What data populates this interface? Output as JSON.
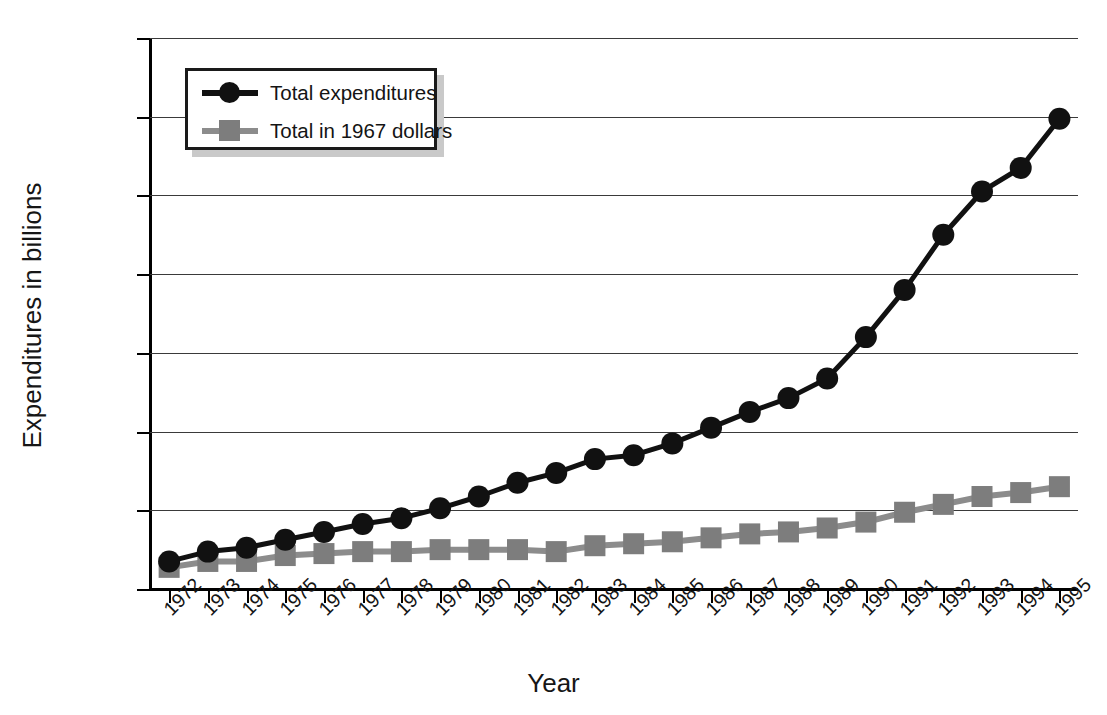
{
  "chart_data": {
    "type": "line",
    "title": "",
    "xlabel": "Year",
    "ylabel": "Expenditures in billions",
    "x": [
      1972,
      1973,
      1974,
      1975,
      1976,
      1977,
      1978,
      1979,
      1980,
      1981,
      1982,
      1983,
      1984,
      1985,
      1986,
      1987,
      1988,
      1989,
      1990,
      1991,
      1992,
      1993,
      1994,
      1995
    ],
    "categories": [
      "1972",
      "1973",
      "1974",
      "1975",
      "1976",
      "1977",
      "1978",
      "1979",
      "1980",
      "1981",
      "1982",
      "1983",
      "1984",
      "1985",
      "1986",
      "1987",
      "1988",
      "1989",
      "1990",
      "1991",
      "1992",
      "1993",
      "1994",
      "1995"
    ],
    "series": [
      {
        "name": "Total expenditures",
        "marker": "circle",
        "color": "#111111",
        "values": [
          7,
          9.5,
          10.5,
          12.5,
          14.5,
          16.5,
          18,
          20.5,
          23.5,
          27,
          29.5,
          33,
          34,
          37,
          41,
          45,
          48.5,
          53.5,
          64,
          76,
          90,
          101,
          107,
          119.5
        ]
      },
      {
        "name": "Total in 1967 dollars",
        "marker": "square",
        "color": "#8c8c8c",
        "values": [
          5.5,
          7,
          7,
          8.5,
          9,
          9.5,
          9.5,
          10,
          10,
          10,
          9.5,
          11,
          11.5,
          12,
          13,
          14,
          14.5,
          15.5,
          17,
          19.5,
          21.5,
          23.5,
          24.5,
          26
        ]
      }
    ],
    "xlim": [
      1972,
      1995
    ],
    "ylim": [
      0,
      140
    ],
    "yticks": [
      0,
      20,
      40,
      60,
      80,
      100,
      120,
      140
    ],
    "ytick_labels": [
      "$0",
      "$20",
      "$40",
      "$60",
      "$80",
      "$100",
      "$120",
      "$140"
    ],
    "grid": "horizontal",
    "legend_position": "top-left"
  },
  "axes": {
    "y_title": "Expenditures in billions",
    "x_title": "Year"
  },
  "legend": {
    "entries": [
      {
        "label": "Total expenditures",
        "marker": "circle-marker-icon",
        "color": "#111111"
      },
      {
        "label": "Total in 1967 dollars",
        "marker": "square-marker-icon",
        "color": "#8c8c8c"
      }
    ]
  },
  "caption": {
    "text": ""
  }
}
